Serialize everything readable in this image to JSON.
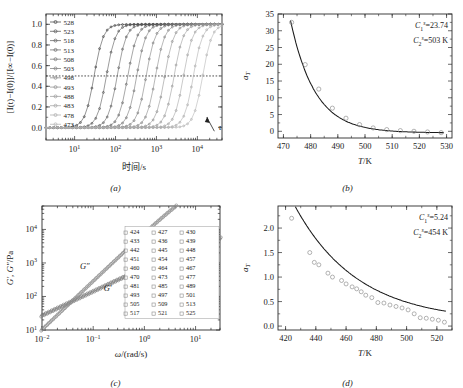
{
  "figure": {
    "panels": [
      "a",
      "b",
      "c",
      "d"
    ]
  },
  "panel_a": {
    "caption": "(a)",
    "xlabel": "时间/s",
    "ylabel_parts": {
      "full": "[I(t)−I(0)]/[I∞−I(0)]"
    },
    "xticks": [
      "10¹",
      "10²",
      "10³",
      "10⁴"
    ],
    "yticks": [
      "0.0",
      "0.2",
      "0.4",
      "0.6",
      "0.8",
      "1.0"
    ],
    "ylim": [
      -0.12,
      1.1
    ],
    "xlim_log": [
      0.3,
      4.6
    ],
    "halfline": 0.5,
    "tau_label": "τ",
    "legend_title": "",
    "legend": [
      "528",
      "523",
      "518",
      "513",
      "508",
      "503",
      "498",
      "493",
      "488",
      "483",
      "478",
      "473"
    ],
    "chart_data": {
      "type": "line",
      "title": "Relative crystallinity vs time",
      "xlabel": "时间/s",
      "ylabel": "[I(t)−I(0)]/[I∞−I(0)]",
      "xscale": "log",
      "xlim": [
        2,
        40000
      ],
      "ylim": [
        -0.12,
        1.1
      ],
      "series": [
        {
          "name": "528",
          "t_half": 30,
          "width": 0.26,
          "color": "#3a3a3a"
        },
        {
          "name": "523",
          "t_half": 60,
          "width": 0.26,
          "color": "#4a4a4a"
        },
        {
          "name": "518",
          "t_half": 110,
          "width": 0.26,
          "color": "#555"
        },
        {
          "name": "513",
          "t_half": 200,
          "width": 0.26,
          "color": "#5f5f5f"
        },
        {
          "name": "508",
          "t_half": 330,
          "width": 0.26,
          "color": "#6a6a6a"
        },
        {
          "name": "503",
          "t_half": 560,
          "width": 0.26,
          "color": "#757575"
        },
        {
          "name": "498",
          "t_half": 950,
          "width": 0.26,
          "color": "#7f7f7f"
        },
        {
          "name": "493",
          "t_half": 1600,
          "width": 0.26,
          "color": "#8a8a8a"
        },
        {
          "name": "488",
          "t_half": 2700,
          "width": 0.26,
          "color": "#949494"
        },
        {
          "name": "483",
          "t_half": 4600,
          "width": 0.26,
          "color": "#9e9e9e"
        },
        {
          "name": "478",
          "t_half": 8000,
          "width": 0.26,
          "color": "#a8a8a8"
        },
        {
          "name": "473",
          "t_half": 13500,
          "width": 0.26,
          "color": "#b0b0b0"
        }
      ]
    }
  },
  "panel_b": {
    "caption": "(b)",
    "xlabel": "T/K",
    "ylabel": "aₜ",
    "xticks": [
      "470",
      "480",
      "490",
      "500",
      "510",
      "520",
      "530"
    ],
    "yticks": [
      "0",
      "5",
      "10",
      "15",
      "20",
      "25",
      "30",
      "35"
    ],
    "ann1": "C₁ˢ=23.74",
    "ann2": "C₂ˢ=503 K",
    "ann1_sym": "C",
    "ann1_sub": "1",
    "ann1_sup": "s",
    "ann1_val": "=23.74",
    "ann2_sym": "C",
    "ann2_sub": "2",
    "ann2_sup": "s",
    "ann2_val": "=503 K",
    "chart_data": {
      "type": "scatter",
      "title": "Shift factor a_T vs temperature",
      "xlabel": "T/K",
      "ylabel": "a_T",
      "xlim": [
        468,
        532
      ],
      "ylim": [
        -2,
        35
      ],
      "points": [
        {
          "x": 473,
          "y": 32.5
        },
        {
          "x": 478,
          "y": 19.9
        },
        {
          "x": 483,
          "y": 12.6
        },
        {
          "x": 488,
          "y": 6.9
        },
        {
          "x": 493,
          "y": 3.9
        },
        {
          "x": 498,
          "y": 2.0
        },
        {
          "x": 503,
          "y": 1.0
        },
        {
          "x": 508,
          "y": 0.5
        },
        {
          "x": 513,
          "y": 0.2
        },
        {
          "x": 518,
          "y": 0.0
        },
        {
          "x": 523,
          "y": -0.2
        },
        {
          "x": 528,
          "y": -0.4
        }
      ],
      "fit_curve": {
        "type": "exponential-decay",
        "C1": 23.74,
        "C2": 503
      }
    }
  },
  "panel_c": {
    "caption": "(c)",
    "xlabel": "ω/(rad/s)",
    "ylabel": "G′, G″/Pa",
    "xticks": [
      "10⁻²",
      "10⁻¹",
      "10⁰",
      "10¹"
    ],
    "yticks": [
      "10¹",
      "10²",
      "10³",
      "10⁴"
    ],
    "label_gp": "G′",
    "label_gpp": "G″",
    "legend_rows": [
      [
        "424",
        "427",
        "430"
      ],
      [
        "433",
        "436",
        "439"
      ],
      [
        "442",
        "445",
        "448"
      ],
      [
        "451",
        "454",
        "457"
      ],
      [
        "460",
        "464",
        "467"
      ],
      [
        "470",
        "473",
        "477"
      ],
      [
        "481",
        "485",
        "489"
      ],
      [
        "493",
        "497",
        "501"
      ],
      [
        "505",
        "509",
        "513"
      ],
      [
        "517",
        "521",
        "525"
      ]
    ],
    "chart_data": {
      "type": "scatter",
      "title": "Master curve of G′ and G″",
      "xlabel": "ω/(rad/s)",
      "ylabel": "G′, G″/Pa",
      "xscale": "log",
      "yscale": "log",
      "xlim": [
        0.01,
        30
      ],
      "ylim": [
        10,
        50000
      ],
      "series": [
        {
          "name": "G″",
          "slope": 0.72,
          "anchor_x": 0.01,
          "anchor_y": 27
        },
        {
          "name": "G′",
          "slope": 1.45,
          "anchor_x": 0.02,
          "anchor_y": 28
        }
      ]
    }
  },
  "panel_d": {
    "caption": "(d)",
    "xlabel": "T/K",
    "ylabel": "aₜ",
    "xticks": [
      "420",
      "440",
      "460",
      "480",
      "500",
      "520"
    ],
    "yticks": [
      "0.0",
      "0.5",
      "1.0",
      "1.5",
      "2.0"
    ],
    "ann1_sym": "C",
    "ann1_sub": "1",
    "ann1_sup": "s",
    "ann1_val": "=5.24",
    "ann2_sym": "C",
    "ann2_sub": "2",
    "ann2_sup": "s",
    "ann2_val": "=454 K",
    "chart_data": {
      "type": "scatter",
      "title": "Shift factor a_T vs temperature",
      "xlabel": "T/K",
      "ylabel": "a_T",
      "xlim": [
        415,
        530
      ],
      "ylim": [
        -0.08,
        2.45
      ],
      "points": [
        {
          "x": 424,
          "y": 2.2
        },
        {
          "x": 436,
          "y": 1.5
        },
        {
          "x": 439,
          "y": 1.3
        },
        {
          "x": 442,
          "y": 1.25
        },
        {
          "x": 448,
          "y": 1.08
        },
        {
          "x": 451,
          "y": 1.0
        },
        {
          "x": 457,
          "y": 0.93
        },
        {
          "x": 460,
          "y": 0.86
        },
        {
          "x": 464,
          "y": 0.8
        },
        {
          "x": 467,
          "y": 0.76
        },
        {
          "x": 470,
          "y": 0.7
        },
        {
          "x": 473,
          "y": 0.63
        },
        {
          "x": 477,
          "y": 0.58
        },
        {
          "x": 481,
          "y": 0.48
        },
        {
          "x": 485,
          "y": 0.47
        },
        {
          "x": 489,
          "y": 0.43
        },
        {
          "x": 493,
          "y": 0.4
        },
        {
          "x": 497,
          "y": 0.37
        },
        {
          "x": 501,
          "y": 0.33
        },
        {
          "x": 505,
          "y": 0.25
        },
        {
          "x": 509,
          "y": 0.17
        },
        {
          "x": 513,
          "y": 0.16
        },
        {
          "x": 517,
          "y": 0.14
        },
        {
          "x": 521,
          "y": 0.12
        },
        {
          "x": 525,
          "y": 0.08
        }
      ],
      "fit_curve": {
        "type": "exponential-decay",
        "C1": 5.24,
        "C2": 454
      }
    }
  }
}
